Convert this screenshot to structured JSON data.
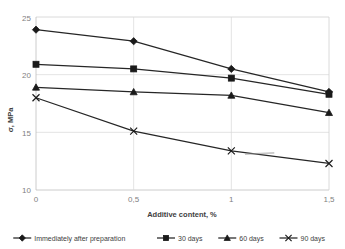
{
  "chart_data": {
    "type": "line",
    "title": "",
    "xlabel": "Additive content, %",
    "ylabel": "σ, MPa",
    "x": [
      0,
      0.5,
      1,
      1.5
    ],
    "xtick_labels": [
      "0",
      "0,5",
      "1",
      "1,5"
    ],
    "ytick_labels": [
      "10",
      "15",
      "20",
      "25"
    ],
    "yticks": [
      10,
      15,
      20,
      25
    ],
    "xlim": [
      0,
      1.5
    ],
    "ylim": [
      10,
      25
    ],
    "grid": true,
    "legend_position": "bottom",
    "series": [
      {
        "name": "Immediately after preparation",
        "marker": "diamond",
        "values": [
          23.9,
          22.9,
          20.5,
          18.5
        ]
      },
      {
        "name": "30 days",
        "marker": "square",
        "values": [
          20.9,
          20.5,
          19.7,
          18.3
        ]
      },
      {
        "name": "60 days",
        "marker": "triangle",
        "values": [
          18.9,
          18.5,
          18.2,
          16.7
        ]
      },
      {
        "name": "90 days",
        "marker": "x-cross",
        "values": [
          18.0,
          15.1,
          13.4,
          12.3
        ]
      }
    ],
    "annotations": [
      {
        "name": "smudge-artifact",
        "text": "",
        "x_range": [
          1.07,
          1.22
        ],
        "y": 13.1
      }
    ],
    "colors": {
      "line": "#262626",
      "marker": "#1a1a1a",
      "grid": "#d9d9d9",
      "axis": "#bfbfbf",
      "tick_text": "#7f7f7f",
      "title_text": "#404040"
    }
  },
  "legend": {
    "items": [
      {
        "label": "Immediately after preparation",
        "marker": "diamond"
      },
      {
        "label": "30 days",
        "marker": "square"
      },
      {
        "label": "60 days",
        "marker": "triangle"
      },
      {
        "label": "90 days",
        "marker": "x-cross"
      }
    ]
  },
  "axes": {
    "x_title": "Additive content, %",
    "y_title": "σ, MPa",
    "x_ticks": [
      "0",
      "0,5",
      "1",
      "1,5"
    ],
    "y_ticks": [
      "25",
      "20",
      "15",
      "10"
    ]
  }
}
